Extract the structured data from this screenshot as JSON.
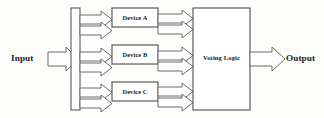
{
  "diagram": {
    "background_color": "#fdfdfb",
    "stroke_color": "#4d4d4d",
    "text_color": "#1c1c1c",
    "input": {
      "label": "Input"
    },
    "output": {
      "label": "Output"
    },
    "bus": {
      "name": "input-distribution-bus"
    },
    "devices": [
      {
        "label": "Device A"
      },
      {
        "label": "Device B"
      },
      {
        "label": "Device C"
      }
    ],
    "voting": {
      "label": "Voting Logic"
    }
  }
}
